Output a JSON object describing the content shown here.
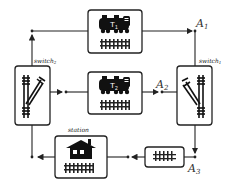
{
  "diagram": {
    "type": "railway-network",
    "nodes": [
      {
        "id": "train1",
        "label": "T1",
        "icon": "train-with-track-icon"
      },
      {
        "id": "train2",
        "label": "T2",
        "icon": "train-with-track-icon"
      },
      {
        "id": "switch1",
        "label": "switch",
        "sub": "1",
        "icon": "railway-switch-icon"
      },
      {
        "id": "switch2",
        "label": "switch",
        "sub": "2",
        "icon": "railway-switch-icon"
      },
      {
        "id": "station",
        "label": "station",
        "icon": "house-with-track-icon"
      },
      {
        "id": "track",
        "label": "",
        "icon": "track-icon"
      }
    ],
    "points": [
      {
        "id": "A1",
        "label": "A",
        "sub": "1"
      },
      {
        "id": "A2",
        "label": "A",
        "sub": "2"
      },
      {
        "id": "A3",
        "label": "A",
        "sub": "3"
      }
    ],
    "edges": [
      {
        "from": "switch2",
        "to": "train1"
      },
      {
        "from": "train1",
        "to": "A1"
      },
      {
        "from": "A1",
        "to": "switch1"
      },
      {
        "from": "switch2",
        "to": "train2"
      },
      {
        "from": "train2",
        "to": "A2"
      },
      {
        "from": "A2",
        "to": "switch1"
      },
      {
        "from": "switch1",
        "to": "A3"
      },
      {
        "from": "A3",
        "to": "track"
      },
      {
        "from": "track",
        "to": "station"
      },
      {
        "from": "station",
        "to": "switch2"
      }
    ]
  },
  "labels": {
    "t1_main": "T",
    "t1_sub": "1",
    "t2_main": "T",
    "t2_sub": "2",
    "a1_main": "A",
    "a1_sub": "1",
    "a2_main": "A",
    "a2_sub": "2",
    "a3_main": "A",
    "a3_sub": "3",
    "switch1_main": "switch",
    "switch1_sub": "1",
    "switch2_main": "switch",
    "switch2_sub": "2",
    "station": "station"
  }
}
